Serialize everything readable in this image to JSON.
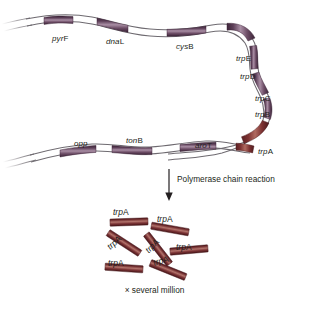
{
  "figure": {
    "background_color": "#ffffff",
    "text_color": "#231f20"
  },
  "chromosome": {
    "strand_color": "#6e6a70",
    "gene_fill_dark": "#4a2f46",
    "gene_fill_light": "#a07f9a",
    "trpa_fill_dark": "#6b2a2c",
    "trpa_fill_light": "#b06a60",
    "top_strand_genes": [
      {
        "name": "pyrF",
        "italic_part": "pyr",
        "upright_part": "F",
        "label_x": 52,
        "label_y": 34
      },
      {
        "name": "dnaL",
        "italic_part": "dna",
        "upright_part": "L",
        "label_x": 106,
        "label_y": 37
      },
      {
        "name": "cysB",
        "italic_part": "cys",
        "upright_part": "B",
        "label_x": 176,
        "label_y": 42
      },
      {
        "name": "trpE",
        "italic_part": "trp",
        "upright_part": "E",
        "label_x": 236,
        "label_y": 54
      },
      {
        "name": "trpD",
        "italic_part": "trp",
        "upright_part": "D",
        "label_x": 240,
        "label_y": 72
      },
      {
        "name": "trpC",
        "italic_part": "trp",
        "upright_part": "C",
        "label_x": 255,
        "label_y": 94
      },
      {
        "name": "trpB",
        "italic_part": "trp",
        "upright_part": "B",
        "label_x": 255,
        "label_y": 110
      },
      {
        "name": "trpA",
        "italic_part": "trp",
        "upright_part": "A",
        "label_x": 258,
        "label_y": 147
      }
    ],
    "bottom_strand_genes": [
      {
        "name": "opp",
        "italic_part": "opp",
        "upright_part": "",
        "label_x": 74,
        "label_y": 139
      },
      {
        "name": "tonB",
        "italic_part": "ton",
        "upright_part": "B",
        "label_x": 126,
        "label_y": 136
      },
      {
        "name": "aroT",
        "italic_part": "aro",
        "upright_part": "T",
        "label_x": 195,
        "label_y": 141
      }
    ]
  },
  "process": {
    "arrow_label": "Polymerase chain reaction",
    "arrow_color": "#231f20"
  },
  "products": {
    "multiplier_text": "× several million",
    "fragment_label": "trpA",
    "fragment_italic_part": "trp",
    "fragment_upright_part": "A",
    "fragment_count": 7,
    "fragments": [
      {
        "id": 1,
        "cx": 129,
        "cy": 222,
        "angle": -2,
        "label_x": 113,
        "label_y": 207,
        "label_angle": 0
      },
      {
        "id": 2,
        "cx": 170,
        "cy": 229,
        "angle": 10,
        "label_x": 157,
        "label_y": 214,
        "label_angle": 0
      },
      {
        "id": 3,
        "cx": 124,
        "cy": 243,
        "angle": 33,
        "label_x": 105,
        "label_y": 244,
        "label_angle": -42
      },
      {
        "id": 4,
        "cx": 158,
        "cy": 249,
        "angle": 52,
        "label_x": 143,
        "label_y": 248,
        "label_angle": -46
      },
      {
        "id": 5,
        "cx": 189,
        "cy": 250,
        "angle": -5,
        "label_x": 176,
        "label_y": 242,
        "label_angle": 0
      },
      {
        "id": 6,
        "cx": 124,
        "cy": 268,
        "angle": 4,
        "label_x": 108,
        "label_y": 258,
        "label_angle": 0
      },
      {
        "id": 7,
        "cx": 168,
        "cy": 270,
        "angle": 22,
        "label_x": 152,
        "label_y": 258,
        "label_angle": -16
      }
    ]
  }
}
